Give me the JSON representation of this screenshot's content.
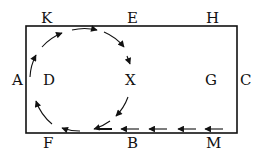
{
  "diagram": {
    "labels": {
      "K": "K",
      "E": "E",
      "H": "H",
      "A": "A",
      "D": "D",
      "X": "X",
      "G": "G",
      "C": "C",
      "F": "F",
      "B": "B",
      "M": "M"
    },
    "colors": {
      "line": "#111111",
      "background": "#ffffff"
    }
  }
}
